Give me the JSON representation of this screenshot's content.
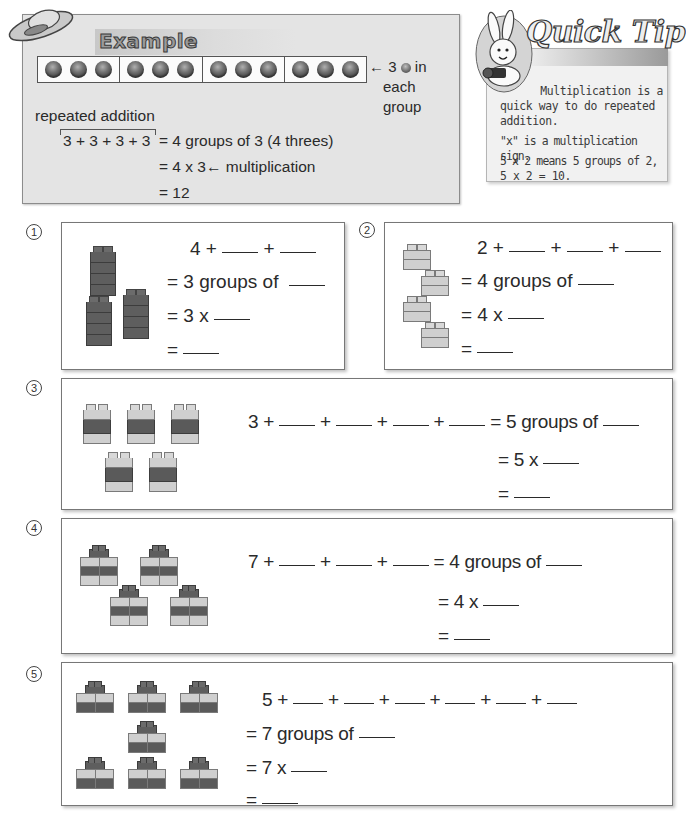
{
  "example": {
    "title": "Example",
    "beads": {
      "groups": 4,
      "per_group": 3
    },
    "strip_note": {
      "line1_prefix": "3",
      "line1_suffix": "in",
      "line2": "each",
      "line3": "group"
    },
    "label_repeated_addition": "repeated addition",
    "line1_left": "3 + 3 + 3 + 3",
    "line1_right": "= 4 groups of 3 (4 threes)",
    "line2": "= 4 x 3",
    "line2_note": "multiplication",
    "line3": "= 12"
  },
  "quick_tip": {
    "title": "Quick Tip",
    "lines": [
      "Multiplication is a",
      "quick way to do repeated",
      "addition.",
      "\"x\" is a multiplication sign.",
      "5 x 2 means 5 groups of 2,",
      "5 x 2 = 10."
    ]
  },
  "exercises": [
    {
      "number": "1",
      "addition_start": "4 +",
      "plus": "+",
      "groups_line": "= 3 groups of",
      "times_line": "= 3 x",
      "equals": "=",
      "blocks": {
        "count": 3,
        "layers": 4,
        "style": "dark towers"
      }
    },
    {
      "number": "2",
      "addition_start": "2 +",
      "plus": "+",
      "groups_line": "= 4 groups of",
      "times_line": "= 4 x",
      "equals": "=",
      "blocks": {
        "count": 4,
        "layers": 2,
        "style": "light bricks"
      }
    },
    {
      "number": "3",
      "addition_start": "3 +",
      "plus": "+",
      "groups_line": "= 5 groups of",
      "times_line": "= 5 x",
      "equals": "=",
      "blocks": {
        "count": 5,
        "layers": 3,
        "style": "light-dark-light towers"
      }
    },
    {
      "number": "4",
      "addition_start": "7 +",
      "plus": "+",
      "groups_line": "= 4 groups of",
      "times_line": "= 4 x",
      "equals": "=",
      "blocks": {
        "count": 4,
        "layers": 7,
        "style": "stacked bricks"
      }
    },
    {
      "number": "5",
      "addition_start": "5 +",
      "plus": "+",
      "groups_line": "= 7 groups of",
      "times_line": "= 7 x",
      "equals": "=",
      "blocks": {
        "count": 7,
        "layers": 5,
        "style": "stacked bricks"
      }
    }
  ]
}
